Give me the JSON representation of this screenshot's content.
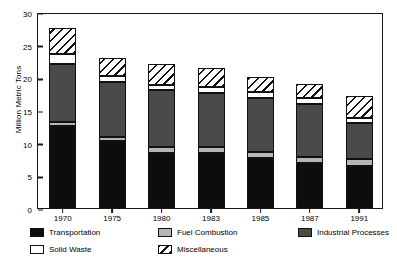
{
  "chart_data": {
    "type": "bar",
    "subtype": "stacked",
    "title": "",
    "xlabel": "",
    "ylabel": "Million Metric Tons",
    "ylim": [
      0,
      30
    ],
    "yticks": [
      0,
      5,
      10,
      15,
      20,
      25,
      30
    ],
    "grid": false,
    "legend_position": "bottom",
    "categories": [
      "1970",
      "1975",
      "1980",
      "1983",
      "1985",
      "1987",
      "1991"
    ],
    "series": [
      {
        "name": "Transportation",
        "color": "#0d0d0d",
        "pattern": "solid",
        "values": [
          12.6,
          10.2,
          8.4,
          8.4,
          7.6,
          6.9,
          6.5
        ]
      },
      {
        "name": "Fuel Combustion",
        "color": "#b5b5b5",
        "pattern": "solid",
        "values": [
          0.6,
          0.6,
          0.9,
          0.9,
          0.9,
          0.9,
          1.0
        ]
      },
      {
        "name": "Industrial Processes",
        "color": "#4a4a4a",
        "pattern": "solid",
        "values": [
          8.9,
          8.5,
          8.7,
          8.3,
          8.4,
          8.1,
          5.5
        ]
      },
      {
        "name": "Solid Waste",
        "color": "#ffffff",
        "pattern": "solid",
        "values": [
          1.5,
          0.9,
          0.9,
          0.9,
          0.9,
          0.9,
          0.8
        ]
      },
      {
        "name": "Miscellaneous",
        "color": "#ffffff",
        "pattern": "hatch",
        "values": [
          4.0,
          2.7,
          3.2,
          3.0,
          2.2,
          2.2,
          3.4
        ]
      }
    ],
    "totals": [
      27.6,
      22.9,
      22.1,
      21.5,
      20.0,
      19.0,
      17.2
    ]
  },
  "legend": {
    "entries": [
      {
        "label": "Transportation"
      },
      {
        "label": "Fuel Combustion"
      },
      {
        "label": "Industrial Processes"
      },
      {
        "label": "Solid Waste"
      },
      {
        "label": "Miscellaneous"
      }
    ]
  }
}
